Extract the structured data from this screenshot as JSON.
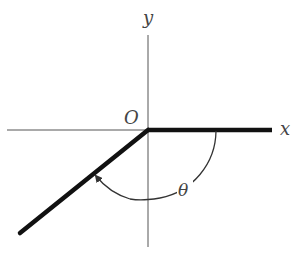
{
  "diagram": {
    "labels": {
      "x_axis": "x",
      "y_axis": "y",
      "origin": "O",
      "angle": "θ"
    },
    "colors": {
      "axis": "#555555",
      "ray": "#111111",
      "arc": "#333333",
      "label": "#444444"
    },
    "geometry": {
      "origin": [
        148,
        130
      ],
      "x_axis_from": [
        7,
        130
      ],
      "y_axis_from": [
        148,
        35
      ],
      "y_axis_to": [
        148,
        247
      ],
      "initial_ray_end": [
        272,
        130
      ],
      "terminal_ray_end": [
        20,
        233
      ],
      "arc_radius": 70,
      "arc_direction": "clockwise"
    }
  }
}
